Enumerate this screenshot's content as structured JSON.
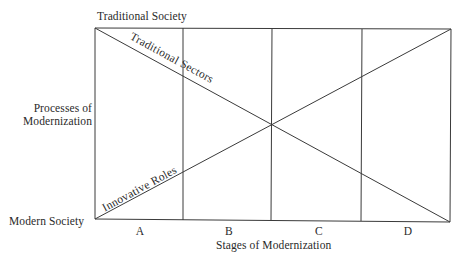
{
  "diagram": {
    "title_top": "Traditional Society",
    "title_bottom_left": "Modern Society",
    "y_axis_label": [
      "Processes of",
      "Modernization"
    ],
    "x_axis_label": "Stages of Modernization",
    "stages": [
      "A",
      "B",
      "C",
      "D"
    ],
    "lines": {
      "descending": "Traditional Sectors",
      "ascending": "Innovative Roles"
    },
    "colors": {
      "line": "#3a3a3a",
      "text": "#2a2a2a",
      "background": "#ffffff"
    }
  }
}
